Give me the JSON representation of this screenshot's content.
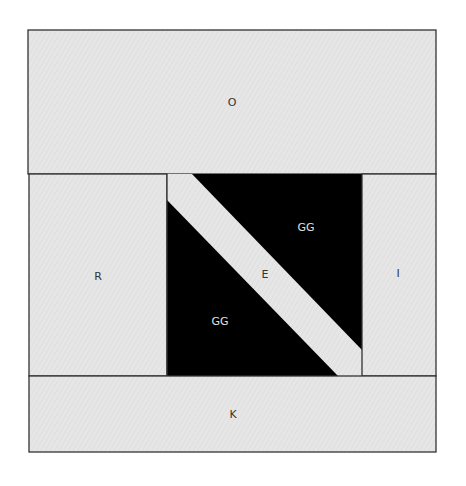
{
  "diagram": {
    "title": "",
    "colors": {
      "fabric_light": "#e6e6e6",
      "fabric_dark": "#000000",
      "outline": "#333333",
      "label_dark": "#333333",
      "label_light": "#e0e0e0"
    },
    "pieces": [
      {
        "id": "O",
        "label": "O",
        "shape": "rectangle",
        "position": "top"
      },
      {
        "id": "R",
        "label": "R",
        "shape": "rectangle",
        "position": "left"
      },
      {
        "id": "GG_top",
        "label": "GG",
        "shape": "triangle",
        "position": "center-upper-right"
      },
      {
        "id": "E",
        "label": "E",
        "shape": "diagonal-strip",
        "position": "center"
      },
      {
        "id": "GG_bottom",
        "label": "GG",
        "shape": "triangle",
        "position": "center-lower-left"
      },
      {
        "id": "I",
        "label": "I",
        "shape": "rectangle",
        "position": "right"
      },
      {
        "id": "K",
        "label": "K",
        "shape": "rectangle",
        "position": "bottom"
      }
    ]
  }
}
